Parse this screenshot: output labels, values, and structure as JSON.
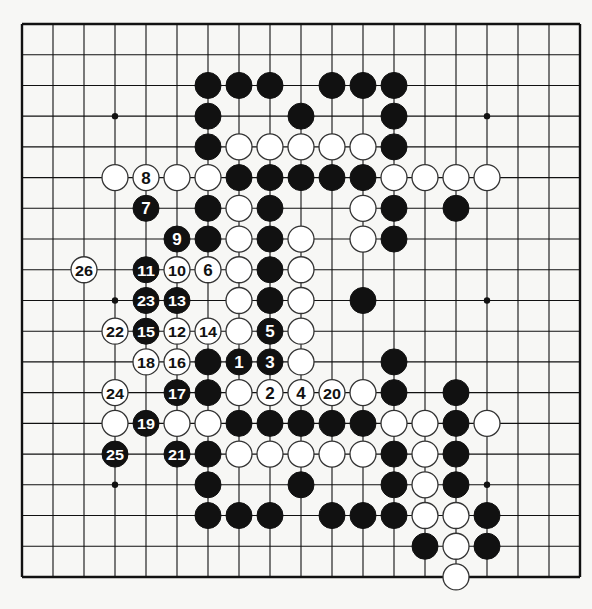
{
  "board": {
    "size": 19,
    "origin_x": 22,
    "origin_y": 24,
    "step_x": 31,
    "step_y": 30.72,
    "stone_radius": 13,
    "line_color": "#111111",
    "stone_black": "#111111",
    "stone_white": "#ffffff",
    "hoshi": [
      [
        3,
        3
      ],
      [
        3,
        9
      ],
      [
        3,
        15
      ],
      [
        9,
        3
      ],
      [
        9,
        9
      ],
      [
        9,
        15
      ],
      [
        15,
        3
      ],
      [
        15,
        9
      ],
      [
        15,
        15
      ]
    ],
    "stones": [
      {
        "r": 2,
        "c": 6,
        "color": "B"
      },
      {
        "r": 2,
        "c": 7,
        "color": "B"
      },
      {
        "r": 2,
        "c": 8,
        "color": "B"
      },
      {
        "r": 2,
        "c": 10,
        "color": "B"
      },
      {
        "r": 2,
        "c": 11,
        "color": "B"
      },
      {
        "r": 2,
        "c": 12,
        "color": "B"
      },
      {
        "r": 3,
        "c": 6,
        "color": "B"
      },
      {
        "r": 3,
        "c": 9,
        "color": "B"
      },
      {
        "r": 3,
        "c": 12,
        "color": "B"
      },
      {
        "r": 4,
        "c": 6,
        "color": "B"
      },
      {
        "r": 4,
        "c": 7,
        "color": "W"
      },
      {
        "r": 4,
        "c": 8,
        "color": "W"
      },
      {
        "r": 4,
        "c": 9,
        "color": "W"
      },
      {
        "r": 4,
        "c": 10,
        "color": "W"
      },
      {
        "r": 4,
        "c": 11,
        "color": "W"
      },
      {
        "r": 4,
        "c": 12,
        "color": "B"
      },
      {
        "r": 5,
        "c": 3,
        "color": "W"
      },
      {
        "r": 5,
        "c": 4,
        "color": "W",
        "label": "8"
      },
      {
        "r": 5,
        "c": 5,
        "color": "W"
      },
      {
        "r": 5,
        "c": 6,
        "color": "W"
      },
      {
        "r": 5,
        "c": 7,
        "color": "B"
      },
      {
        "r": 5,
        "c": 8,
        "color": "B"
      },
      {
        "r": 5,
        "c": 9,
        "color": "B"
      },
      {
        "r": 5,
        "c": 10,
        "color": "B"
      },
      {
        "r": 5,
        "c": 11,
        "color": "B"
      },
      {
        "r": 5,
        "c": 12,
        "color": "W"
      },
      {
        "r": 5,
        "c": 13,
        "color": "W"
      },
      {
        "r": 5,
        "c": 14,
        "color": "W"
      },
      {
        "r": 5,
        "c": 15,
        "color": "W"
      },
      {
        "r": 6,
        "c": 4,
        "color": "B",
        "label": "7"
      },
      {
        "r": 6,
        "c": 6,
        "color": "B"
      },
      {
        "r": 6,
        "c": 7,
        "color": "W"
      },
      {
        "r": 6,
        "c": 8,
        "color": "B"
      },
      {
        "r": 6,
        "c": 11,
        "color": "W"
      },
      {
        "r": 6,
        "c": 12,
        "color": "B"
      },
      {
        "r": 6,
        "c": 14,
        "color": "B"
      },
      {
        "r": 7,
        "c": 5,
        "color": "B",
        "label": "9"
      },
      {
        "r": 7,
        "c": 6,
        "color": "B"
      },
      {
        "r": 7,
        "c": 7,
        "color": "W"
      },
      {
        "r": 7,
        "c": 8,
        "color": "B"
      },
      {
        "r": 7,
        "c": 9,
        "color": "W"
      },
      {
        "r": 7,
        "c": 11,
        "color": "W"
      },
      {
        "r": 7,
        "c": 12,
        "color": "B"
      },
      {
        "r": 8,
        "c": 2,
        "color": "W",
        "label": "26"
      },
      {
        "r": 8,
        "c": 4,
        "color": "B",
        "label": "11"
      },
      {
        "r": 8,
        "c": 5,
        "color": "W",
        "label": "10"
      },
      {
        "r": 8,
        "c": 6,
        "color": "W",
        "label": "6"
      },
      {
        "r": 8,
        "c": 7,
        "color": "W"
      },
      {
        "r": 8,
        "c": 8,
        "color": "B"
      },
      {
        "r": 8,
        "c": 9,
        "color": "W"
      },
      {
        "r": 9,
        "c": 4,
        "color": "B",
        "label": "23"
      },
      {
        "r": 9,
        "c": 5,
        "color": "B",
        "label": "13"
      },
      {
        "r": 9,
        "c": 7,
        "color": "W"
      },
      {
        "r": 9,
        "c": 8,
        "color": "B"
      },
      {
        "r": 9,
        "c": 9,
        "color": "W"
      },
      {
        "r": 9,
        "c": 11,
        "color": "B"
      },
      {
        "r": 10,
        "c": 3,
        "color": "W",
        "label": "22"
      },
      {
        "r": 10,
        "c": 4,
        "color": "B",
        "label": "15"
      },
      {
        "r": 10,
        "c": 5,
        "color": "W",
        "label": "12"
      },
      {
        "r": 10,
        "c": 6,
        "color": "W",
        "label": "14"
      },
      {
        "r": 10,
        "c": 7,
        "color": "W"
      },
      {
        "r": 10,
        "c": 8,
        "color": "B",
        "label": "5"
      },
      {
        "r": 10,
        "c": 9,
        "color": "W"
      },
      {
        "r": 11,
        "c": 4,
        "color": "W",
        "label": "18"
      },
      {
        "r": 11,
        "c": 5,
        "color": "W",
        "label": "16"
      },
      {
        "r": 11,
        "c": 6,
        "color": "B"
      },
      {
        "r": 11,
        "c": 7,
        "color": "B",
        "label": "1"
      },
      {
        "r": 11,
        "c": 8,
        "color": "B",
        "label": "3"
      },
      {
        "r": 11,
        "c": 9,
        "color": "W"
      },
      {
        "r": 11,
        "c": 12,
        "color": "B"
      },
      {
        "r": 12,
        "c": 3,
        "color": "W",
        "label": "24"
      },
      {
        "r": 12,
        "c": 5,
        "color": "B",
        "label": "17"
      },
      {
        "r": 12,
        "c": 6,
        "color": "B"
      },
      {
        "r": 12,
        "c": 7,
        "color": "W"
      },
      {
        "r": 12,
        "c": 8,
        "color": "W",
        "label": "2"
      },
      {
        "r": 12,
        "c": 9,
        "color": "W",
        "label": "4"
      },
      {
        "r": 12,
        "c": 10,
        "color": "W",
        "label": "20"
      },
      {
        "r": 12,
        "c": 11,
        "color": "W"
      },
      {
        "r": 12,
        "c": 12,
        "color": "B"
      },
      {
        "r": 12,
        "c": 14,
        "color": "B"
      },
      {
        "r": 13,
        "c": 3,
        "color": "W"
      },
      {
        "r": 13,
        "c": 4,
        "color": "B",
        "label": "19"
      },
      {
        "r": 13,
        "c": 5,
        "color": "W"
      },
      {
        "r": 13,
        "c": 6,
        "color": "W"
      },
      {
        "r": 13,
        "c": 7,
        "color": "B"
      },
      {
        "r": 13,
        "c": 8,
        "color": "B"
      },
      {
        "r": 13,
        "c": 9,
        "color": "B"
      },
      {
        "r": 13,
        "c": 10,
        "color": "B"
      },
      {
        "r": 13,
        "c": 11,
        "color": "B"
      },
      {
        "r": 13,
        "c": 12,
        "color": "W"
      },
      {
        "r": 13,
        "c": 13,
        "color": "W"
      },
      {
        "r": 13,
        "c": 14,
        "color": "B"
      },
      {
        "r": 13,
        "c": 15,
        "color": "W"
      },
      {
        "r": 14,
        "c": 3,
        "color": "B",
        "label": "25"
      },
      {
        "r": 14,
        "c": 5,
        "color": "B",
        "label": "21"
      },
      {
        "r": 14,
        "c": 6,
        "color": "B"
      },
      {
        "r": 14,
        "c": 7,
        "color": "W"
      },
      {
        "r": 14,
        "c": 8,
        "color": "W"
      },
      {
        "r": 14,
        "c": 9,
        "color": "W"
      },
      {
        "r": 14,
        "c": 10,
        "color": "W"
      },
      {
        "r": 14,
        "c": 11,
        "color": "W"
      },
      {
        "r": 14,
        "c": 12,
        "color": "B"
      },
      {
        "r": 14,
        "c": 13,
        "color": "W"
      },
      {
        "r": 14,
        "c": 14,
        "color": "B"
      },
      {
        "r": 15,
        "c": 6,
        "color": "B"
      },
      {
        "r": 15,
        "c": 9,
        "color": "B"
      },
      {
        "r": 15,
        "c": 12,
        "color": "B"
      },
      {
        "r": 15,
        "c": 13,
        "color": "W"
      },
      {
        "r": 15,
        "c": 14,
        "color": "B"
      },
      {
        "r": 16,
        "c": 6,
        "color": "B"
      },
      {
        "r": 16,
        "c": 7,
        "color": "B"
      },
      {
        "r": 16,
        "c": 8,
        "color": "B"
      },
      {
        "r": 16,
        "c": 10,
        "color": "B"
      },
      {
        "r": 16,
        "c": 11,
        "color": "B"
      },
      {
        "r": 16,
        "c": 12,
        "color": "B"
      },
      {
        "r": 16,
        "c": 13,
        "color": "W"
      },
      {
        "r": 16,
        "c": 14,
        "color": "W"
      },
      {
        "r": 16,
        "c": 15,
        "color": "B"
      },
      {
        "r": 17,
        "c": 13,
        "color": "B"
      },
      {
        "r": 17,
        "c": 14,
        "color": "W"
      },
      {
        "r": 17,
        "c": 15,
        "color": "B"
      },
      {
        "r": 18,
        "c": 14,
        "color": "W"
      }
    ]
  }
}
